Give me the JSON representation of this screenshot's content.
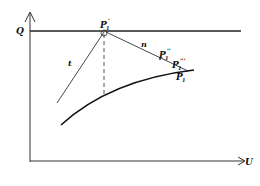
{
  "diagram": {
    "axes": {
      "y_label": "Q",
      "x_label": "U"
    },
    "lines": {
      "tangent_label": "t",
      "normal_label": "n"
    },
    "points": {
      "p1_prime": {
        "base": "P",
        "sub": "1",
        "sup": "'"
      },
      "p1_double": {
        "base": "P",
        "sub": "1",
        "sup": "''"
      },
      "p1_triple": {
        "base": "P",
        "sub": "1",
        "sup": "'''"
      },
      "p1": {
        "base": "P",
        "sub": "1",
        "sup": ""
      }
    },
    "colors": {
      "ink": "#111111",
      "background": "#ffffff"
    }
  }
}
